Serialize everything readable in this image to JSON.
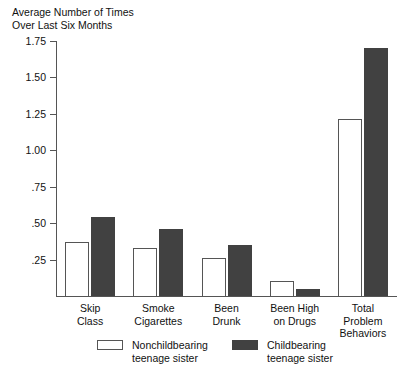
{
  "chart_data": {
    "type": "bar",
    "title": "Average Number of Times\nOver Last Six Months",
    "xlabel": "",
    "ylabel": "Average Number of Times Over Last Six Months",
    "ylim": [
      0,
      1.75
    ],
    "grid": false,
    "legend_position": "bottom",
    "ytick_labels": [
      "1.75",
      "1.50",
      "1.25",
      "1.00",
      ".75",
      ".50",
      ".25"
    ],
    "ytick_values": [
      1.75,
      1.5,
      1.25,
      1.0,
      0.75,
      0.5,
      0.25
    ],
    "categories": [
      "Skip\nClass",
      "Smoke\nCigarettes",
      "Been\nDrunk",
      "Been High\non Drugs",
      "Total\nProblem\nBehaviors"
    ],
    "series": [
      {
        "name": "Nonchildbearing\nteenage sister",
        "color": "#ffffff",
        "values": [
          0.37,
          0.33,
          0.26,
          0.1,
          1.21
        ]
      },
      {
        "name": "Childbearing\nteenage sister",
        "color": "#414141",
        "values": [
          0.54,
          0.46,
          0.35,
          0.05,
          1.7
        ]
      }
    ]
  },
  "legend": {
    "items": [
      {
        "label": "Nonchildbearing\nteenage sister",
        "swatch": "light"
      },
      {
        "label": "Childbearing\nteenage sister",
        "swatch": "dark"
      }
    ]
  }
}
